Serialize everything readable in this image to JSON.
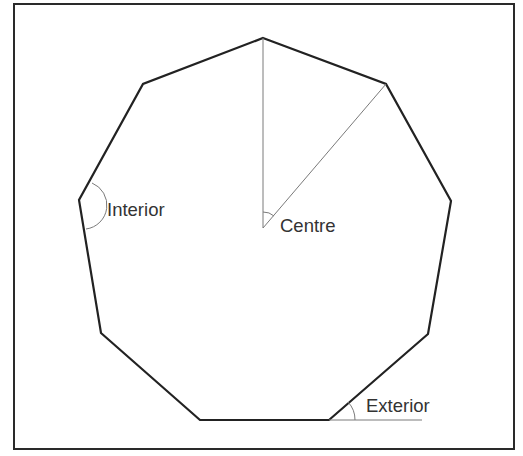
{
  "diagram": {
    "shape": "regular nonagon",
    "sides": 9,
    "frame": {
      "x": 14,
      "y": 4,
      "width": 500,
      "height": 445,
      "stroke": "#2a2a2a"
    },
    "colors": {
      "polygon_stroke": "#222222",
      "construction_stroke": "#7a7a7a",
      "label_text": "#333333",
      "background": "#ffffff"
    },
    "vertices": [
      [
        263,
        38
      ],
      [
        386,
        84
      ],
      [
        451,
        201
      ],
      [
        428,
        334
      ],
      [
        329,
        420
      ],
      [
        200,
        420
      ],
      [
        101,
        333
      ],
      [
        79,
        200
      ],
      [
        143,
        84
      ]
    ],
    "centre_point": [
      263,
      228
    ],
    "radii_lines": [
      {
        "from": [
          263,
          228
        ],
        "to": [
          263,
          38
        ]
      },
      {
        "from": [
          263,
          228
        ],
        "to": [
          386,
          84
        ]
      }
    ],
    "extension_line": {
      "from": [
        329,
        420
      ],
      "to": [
        422,
        420
      ]
    },
    "labels": {
      "interior": "Interior",
      "centre": "Centre",
      "exterior": "Exterior"
    },
    "label_positions": {
      "interior": [
        107,
        216
      ],
      "centre": [
        280,
        232
      ],
      "exterior": [
        366,
        412
      ]
    },
    "angle_marks": {
      "interior": "M 92 183 A 24 24 0 0 1 86 229",
      "centre": "M 263 212 A 16 16 0 0 1 274 216",
      "exterior": "M 355 420 A 26 26 0 0 0 348 402"
    }
  }
}
